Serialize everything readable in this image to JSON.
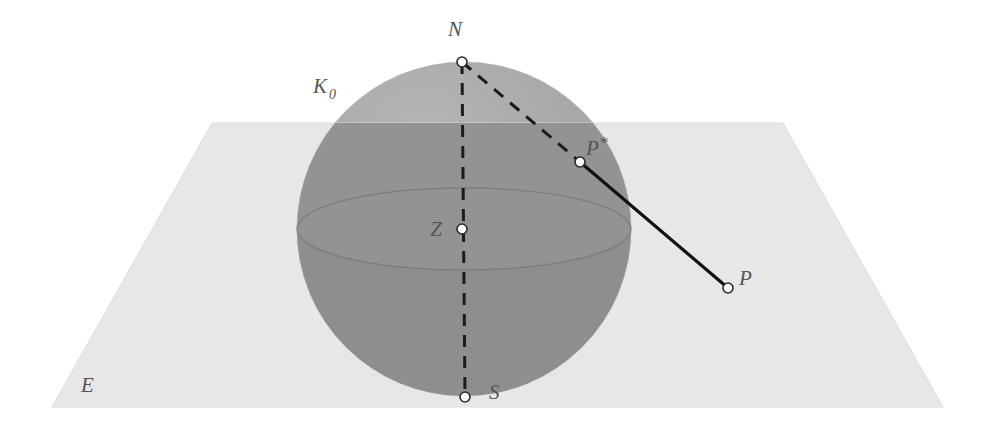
{
  "figure": {
    "width": 993,
    "height": 428,
    "background_color": "#ffffff"
  },
  "labels": {
    "sphere_circle": "K",
    "sphere_circle_subscript": "0",
    "north_pole": "N",
    "center": "Z",
    "south_pole": "S",
    "projected_point": "P",
    "projected_point_star": "*",
    "plane_point": "P",
    "plane": "E"
  },
  "points": [
    {
      "name": "north-pole",
      "label": "N",
      "x": 462,
      "y": 62
    },
    {
      "name": "center",
      "label": "Z",
      "x": 462,
      "y": 229
    },
    {
      "name": "south-pole",
      "label": "S",
      "x": 465,
      "y": 397
    },
    {
      "name": "sphere-point",
      "label": "P*",
      "x": 580,
      "y": 162
    },
    {
      "name": "plane-point",
      "label": "P",
      "x": 728,
      "y": 288
    }
  ],
  "sphere": {
    "center_x": 464,
    "center_y": 229,
    "radius": 167,
    "equator_ry": 41,
    "upper_fill": "#aaaaaa",
    "band_fill": "#8f8f8f",
    "lower_fill": "#d6d6d6"
  },
  "plane": {
    "corners": "212,123 783,123 943,407 52,407",
    "fill": "#e2e2e2",
    "edge_color": "#d2d2d2",
    "horizon_y": 123,
    "front_y": 407
  },
  "lines": {
    "axis_dashed": "N to S vertical axis",
    "ray_dashed": "N to P* projection ray",
    "ray_solid": "P* to P segment",
    "dash_color": "#1c1c1c",
    "solid_color": "#111111"
  },
  "colors": {
    "label_text": "#555555",
    "dot_fill": "#ffffff",
    "dot_stroke": "#2a2a2a"
  }
}
